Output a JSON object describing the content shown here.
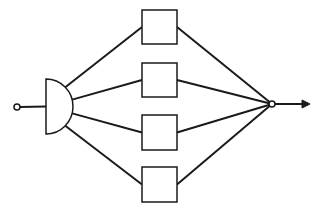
{
  "diagram": {
    "type": "parallel-block-diagram",
    "stroke_color": "#1a1a1a",
    "background": "#ffffff",
    "input_node": {
      "cx": 17,
      "cy": 107,
      "r": 3
    },
    "splitter": {
      "x": 46,
      "top": 79,
      "bottom": 134,
      "bulge": 27
    },
    "blocks": [
      {
        "id": "block-1",
        "x": 142,
        "y": 10,
        "w": 35,
        "h": 34
      },
      {
        "id": "block-2",
        "x": 142,
        "y": 63,
        "w": 35,
        "h": 34
      },
      {
        "id": "block-3",
        "x": 142,
        "y": 115,
        "w": 35,
        "h": 35
      },
      {
        "id": "block-4",
        "x": 142,
        "y": 167,
        "w": 35,
        "h": 35
      }
    ],
    "output_node": {
      "cx": 272,
      "cy": 104,
      "r": 3
    },
    "output_arrow": {
      "x1": 275,
      "x2": 310,
      "y": 104
    }
  }
}
